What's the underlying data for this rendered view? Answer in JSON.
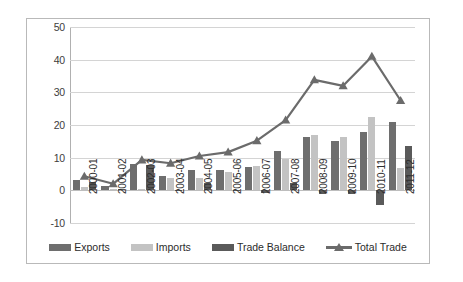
{
  "chart_data": {
    "type": "bar",
    "title": "",
    "xlabel": "",
    "ylabel": "",
    "ylim": [
      -10,
      50
    ],
    "ytick_step": 10,
    "yticks": [
      50,
      40,
      30,
      20,
      10,
      0,
      -10
    ],
    "grid": true,
    "legend_position": "bottom",
    "categories": [
      "2000-01",
      "2001-02",
      "2002-03",
      "2003-04",
      "2004-05",
      "2005-06",
      "2006-07",
      "2007-08",
      "2008-09",
      "2009-10",
      "2010-11",
      "2011-12"
    ],
    "series": [
      {
        "name": "Exports",
        "kind": "bar",
        "color": "#6e6e6e",
        "values": [
          3.2,
          1.2,
          8.2,
          4.3,
          6.3,
          6.1,
          7.1,
          12.1,
          16.2,
          15.2,
          18.0,
          20.8
        ]
      },
      {
        "name": "Imports",
        "kind": "bar",
        "color": "#c3c3c3",
        "values": [
          1.0,
          0.5,
          0.3,
          3.7,
          3.8,
          5.6,
          7.6,
          9.5,
          17.0,
          16.4,
          22.4,
          6.8
        ]
      },
      {
        "name": "Trade Balance",
        "kind": "bar",
        "color": "#5a5a5a",
        "values": [
          2.5,
          0.5,
          7.8,
          0.2,
          2.3,
          0.0,
          -0.8,
          2.2,
          -1.0,
          -1.2,
          -4.5,
          13.7
        ]
      },
      {
        "name": "Total Trade",
        "kind": "line",
        "color": "#6b6b6b",
        "marker": "triangle",
        "values": [
          4.3,
          2.0,
          9.3,
          8.3,
          10.5,
          11.7,
          15.2,
          21.5,
          33.8,
          32.0,
          41.0,
          27.5
        ]
      }
    ]
  }
}
